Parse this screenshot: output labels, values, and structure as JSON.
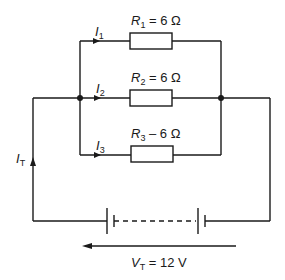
{
  "diagram": {
    "type": "parallel-resistor-circuit",
    "branches": [
      {
        "current_symbol": "I",
        "current_sub": "1",
        "resistor_symbol": "R",
        "resistor_sub": "1",
        "value_text": "= 6 Ω"
      },
      {
        "current_symbol": "I",
        "current_sub": "2",
        "resistor_symbol": "R",
        "resistor_sub": "2",
        "value_text": "= 6 Ω"
      },
      {
        "current_symbol": "I",
        "current_sub": "3",
        "resistor_symbol": "R",
        "resistor_sub": "3",
        "value_text": "– 6 Ω"
      }
    ],
    "total_current": {
      "symbol": "I",
      "sub": "T"
    },
    "supply": {
      "symbol": "V",
      "sub": "T",
      "value_text": "= 12 V"
    },
    "colors": {
      "ink": "#1a1a1a",
      "background": "#ffffff"
    }
  }
}
